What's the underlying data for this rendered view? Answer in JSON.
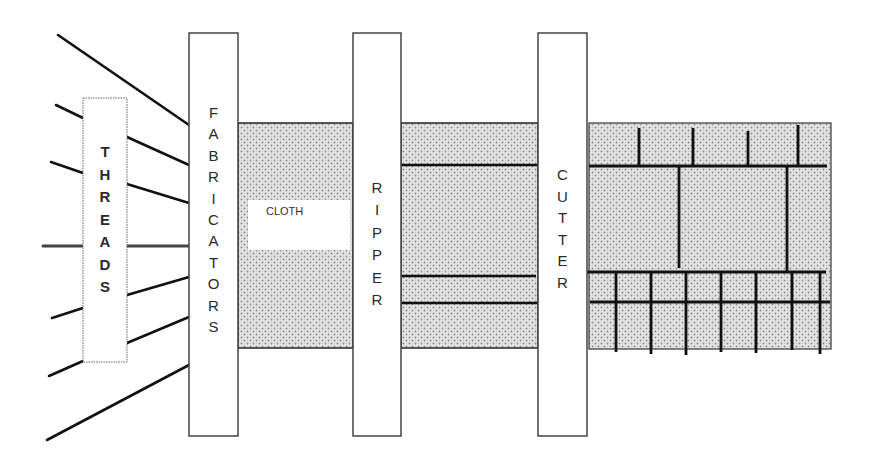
{
  "diagram": {
    "colors": {
      "line": "#111111",
      "box_border": "#555555",
      "cloth_fill": "#dcdcdc",
      "cloth_dot": "#8a8a8a",
      "background": "#ffffff"
    },
    "labels": {
      "threads": "THREADS",
      "fabricators": "FABRICATORS",
      "cloth": "CLOTH",
      "ripper": "RIPPER",
      "cutter": "CUTTER"
    },
    "stages": [
      {
        "id": "threads",
        "label": "THREADS"
      },
      {
        "id": "fabricators",
        "label": "FABRICATORS"
      },
      {
        "id": "cloth",
        "label": "CLOTH"
      },
      {
        "id": "ripper",
        "label": "RIPPER"
      },
      {
        "id": "ripped-cloth",
        "label": ""
      },
      {
        "id": "cutter",
        "label": "CUTTER"
      },
      {
        "id": "cut-pieces",
        "label": ""
      }
    ]
  }
}
